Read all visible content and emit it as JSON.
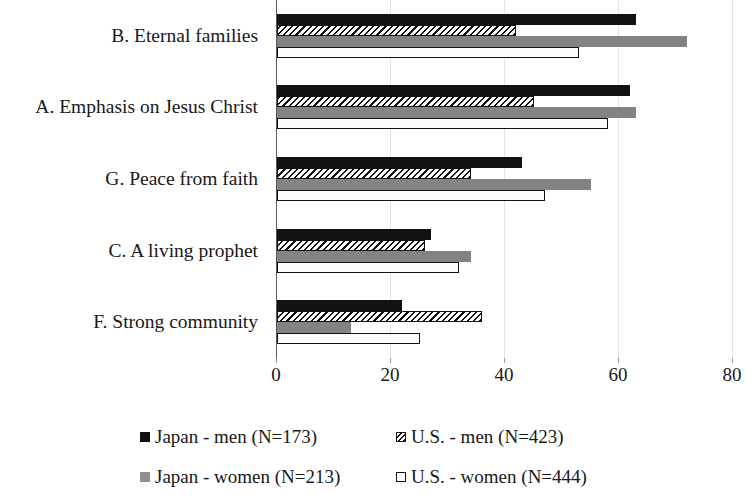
{
  "chart_data": {
    "type": "bar",
    "orientation": "horizontal",
    "title": "",
    "subtitle": "",
    "xlabel": "",
    "ylabel": "",
    "xlim": [
      0,
      80
    ],
    "xticks": [
      0,
      20,
      40,
      60,
      80
    ],
    "xtick_labels": [
      "0",
      "20",
      "40",
      "60",
      "80"
    ],
    "grid": true,
    "grid_axis": "x",
    "legend_position": "bottom",
    "categories": [
      "B. Eternal families",
      "A. Emphasis on Jesus Christ",
      "G. Peace from faith",
      "C. A living prophet",
      "F. Strong community"
    ],
    "series": [
      {
        "name": "Japan - men (N=173)",
        "key": "japan_men",
        "color": "#121212",
        "pattern": "solid",
        "values": [
          63,
          62,
          43,
          27,
          22
        ]
      },
      {
        "name": "U.S. - men (N=423)",
        "key": "us_men",
        "color": "#ffffff",
        "pattern": "diagonal-hatch",
        "values": [
          42,
          45,
          34,
          26,
          36
        ]
      },
      {
        "name": "Japan - women (N=213)",
        "key": "japan_women",
        "color": "#838383",
        "pattern": "solid",
        "values": [
          72,
          63,
          55,
          34,
          13
        ]
      },
      {
        "name": "U.S. - women (N=444)",
        "key": "us_women",
        "color": "#ffffff",
        "pattern": "outline",
        "values": [
          53,
          58,
          47,
          32,
          25
        ]
      }
    ]
  },
  "legend": {
    "items": [
      {
        "label": "Japan - men (N=173)",
        "swatch": "solid-black-swatch"
      },
      {
        "label": "U.S. - men (N=423)",
        "swatch": "hatched-swatch"
      },
      {
        "label": "Japan - women (N=213)",
        "swatch": "solid-gray-swatch"
      },
      {
        "label": "U.S. - women (N=444)",
        "swatch": "outline-swatch"
      }
    ]
  }
}
